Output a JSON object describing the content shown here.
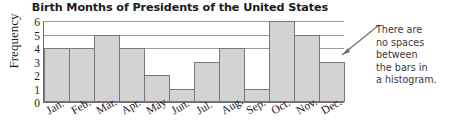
{
  "chart_data": {
    "type": "bar",
    "title": "Birth Months of Presidents of the United States",
    "xlabel": "",
    "ylabel": "Frequency",
    "categories": [
      "Jan.",
      "Feb.",
      "Mar.",
      "Apr.",
      "May",
      "Jun.",
      "Jul.",
      "Aug.",
      "Sep.",
      "Oct.",
      "Nov.",
      "Dec."
    ],
    "values": [
      4,
      4,
      5,
      4,
      2,
      1,
      3,
      4,
      1,
      6,
      5,
      3
    ],
    "ylim": [
      0,
      6
    ],
    "yticks": [
      0,
      1,
      2,
      3,
      4,
      5,
      6
    ],
    "ytick_labels": [
      "0",
      "1",
      "2",
      "3",
      "4",
      "5",
      "6"
    ],
    "grid": true,
    "gridlines_y": [
      4,
      5,
      6
    ],
    "legend": null,
    "bar_fill": "#d3d3d3",
    "bar_stroke": "#787878",
    "axis_color": "#6e6e6e",
    "annotations": [
      {
        "text": "There are no spaces between the bars in a histogram.",
        "lines": [
          "There are",
          "no spaces",
          "between",
          "the bars in",
          "a histogram."
        ],
        "points_to": "Dec."
      }
    ]
  }
}
